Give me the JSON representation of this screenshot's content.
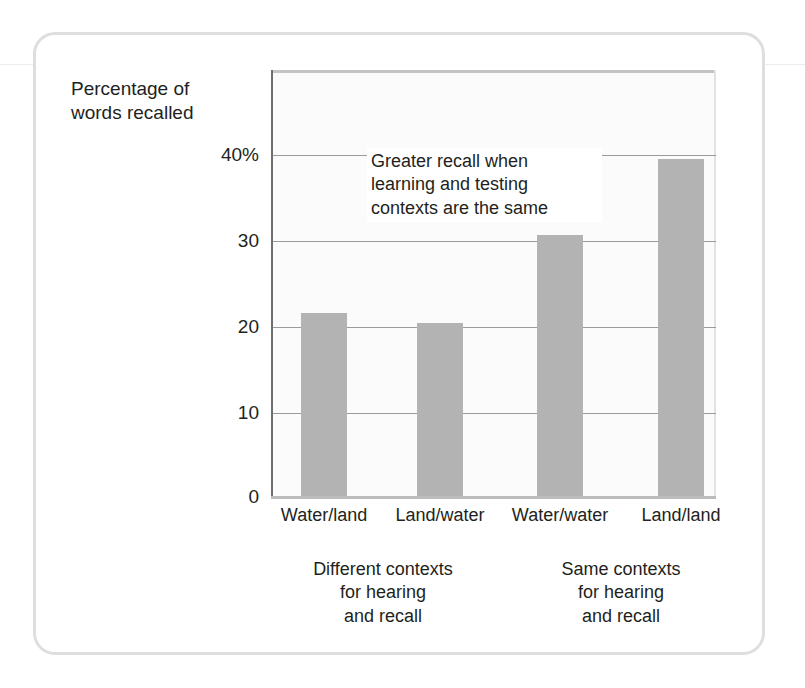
{
  "chart_data": {
    "type": "bar",
    "title": "",
    "subtitle": "",
    "xlabel": "",
    "ylabel": "Percentage of words recalled",
    "ylabel_lines": [
      "Percentage of",
      "words recalled"
    ],
    "categories": [
      "Water/land",
      "Land/water",
      "Water/water",
      "Land/land"
    ],
    "values": [
      21.4,
      20.3,
      30.5,
      39.3
    ],
    "ylim": [
      0,
      49.7
    ],
    "yticks": [
      0,
      10,
      20,
      30,
      40
    ],
    "ytick_labels": [
      "0",
      "10",
      "20",
      "30",
      "40%"
    ],
    "grid": true,
    "legend": "none",
    "bar_color": "#b3b3b3",
    "annotations": [
      {
        "text": "Greater recall when learning and testing contexts are the same",
        "lines": [
          "Greater recall when",
          "learning and testing",
          "contexts are the same"
        ]
      }
    ],
    "group_captions": [
      {
        "text": "Different contexts for hearing and recall",
        "lines": [
          "Different contexts",
          "for hearing",
          "and recall"
        ],
        "covers": [
          "Water/land",
          "Land/water"
        ]
      },
      {
        "text": "Same contexts for hearing and recall",
        "lines": [
          "Same contexts",
          "for hearing",
          "and recall"
        ],
        "covers": [
          "Water/water",
          "Land/land"
        ]
      }
    ]
  },
  "figure": {
    "border_color": "#dedede",
    "background": "#ffffff"
  }
}
